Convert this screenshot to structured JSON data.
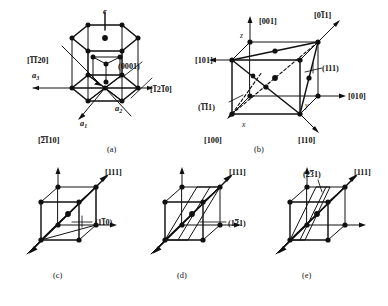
{
  "figure": {
    "stroke_color": "#111111",
    "background_color": "#ffffff",
    "node_color": "#111111"
  },
  "panels": [
    {
      "id": "a",
      "caption": "(a)",
      "cell_type": "hexagonal",
      "labels": {
        "c_axis": "c",
        "a1": "a₁",
        "a2": "a₂",
        "a3": "a₃",
        "dir_1120": "[1120]",
        "dir_1120_bars": [
          1,
          1,
          0,
          0
        ],
        "dir_1210": "[1210]",
        "dir_1210_bars": [
          1,
          0,
          1,
          0
        ],
        "dir_2110": "[2110]",
        "dir_2110_bars": [
          1,
          1,
          0,
          0
        ],
        "plane_0001": "(0001)"
      }
    },
    {
      "id": "b",
      "caption": "(b)",
      "cell_type": "cubic",
      "labels": {
        "axis_x": "x",
        "axis_y": "y",
        "axis_z": "z",
        "dir_001": "[001]",
        "dir_011": "[011]",
        "dir_101": "[101]",
        "dir_010": "[010]",
        "dir_100": "[100]",
        "dir_110": "[110]",
        "plane_111_right": "(111)",
        "plane_111_left": "(111)",
        "plane_111_left_bars": [
          1,
          1,
          0
        ]
      }
    },
    {
      "id": "c",
      "caption": "(c)",
      "cell_type": "cubic",
      "labels": {
        "dir_111": "[111]",
        "plane": "(110)",
        "plane_bars": [
          0,
          1,
          0
        ]
      }
    },
    {
      "id": "d",
      "caption": "(d)",
      "cell_type": "cubic",
      "labels": {
        "dir_111": "[111]",
        "plane": "(121)",
        "plane_bars": [
          0,
          1,
          0
        ]
      }
    },
    {
      "id": "e",
      "caption": "(e)",
      "cell_type": "cubic",
      "labels": {
        "dir_111": "[111]",
        "plane": "(231)",
        "plane_bars": [
          0,
          1,
          0
        ]
      }
    }
  ]
}
